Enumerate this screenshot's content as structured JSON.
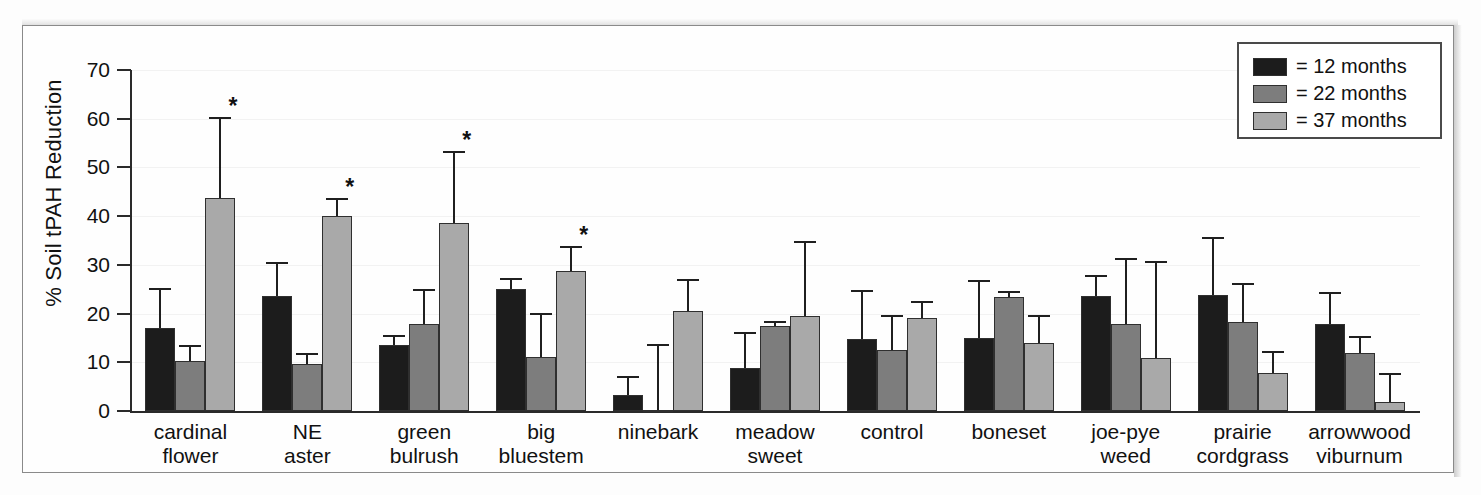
{
  "figure": {
    "ylabel": "% Soil tPAH Reduction",
    "y_ticks": [
      "0",
      "10",
      "20",
      "30",
      "40",
      "50",
      "60",
      "70"
    ],
    "significance_marker": "*"
  },
  "legend": {
    "items": [
      {
        "label": "= 12 months",
        "color": "#1c1c1c",
        "icon": "legend-swatch"
      },
      {
        "label": "= 22 months",
        "color": "#7d7d7d",
        "icon": "legend-swatch"
      },
      {
        "label": "= 37 months",
        "color": "#a9a9a9",
        "icon": "legend-swatch"
      }
    ]
  },
  "chart_data": {
    "type": "bar",
    "title": "",
    "xlabel": "",
    "ylabel": "% Soil tPAH Reduction",
    "ylim": [
      0,
      70
    ],
    "yticks": [
      0,
      10,
      20,
      30,
      40,
      50,
      60,
      70
    ],
    "grid": true,
    "legend_position": "top-right",
    "categories": [
      "cardinal flower",
      "NE aster",
      "green bulrush",
      "big bluestem",
      "ninebark",
      "meadow sweet",
      "control",
      "boneset",
      "joe-pye weed",
      "prairie cordgrass",
      "arrowwood viburnum"
    ],
    "category_lines": [
      [
        "cardinal",
        "flower"
      ],
      [
        "NE",
        "aster"
      ],
      [
        "green",
        "bulrush"
      ],
      [
        "big",
        "bluestem"
      ],
      [
        "ninebark",
        ""
      ],
      [
        "meadow",
        "sweet"
      ],
      [
        "control",
        ""
      ],
      [
        "boneset",
        ""
      ],
      [
        "joe-pye",
        "weed"
      ],
      [
        "prairie",
        "cordgrass"
      ],
      [
        "arrowwood",
        "viburnum"
      ]
    ],
    "series": [
      {
        "name": "12 months",
        "color": "#1c1c1c",
        "values": [
          17.1,
          23.7,
          13.5,
          25.0,
          3.2,
          8.8,
          14.7,
          15.0,
          23.7,
          23.8,
          17.8
        ],
        "errors_upper": [
          8.2,
          6.8,
          2.2,
          2.3,
          4.0,
          7.5,
          10.2,
          11.8,
          4.3,
          12.0,
          6.6
        ],
        "significant": [
          false,
          false,
          false,
          false,
          false,
          false,
          false,
          false,
          false,
          false,
          false
        ]
      },
      {
        "name": "22 months",
        "color": "#7d7d7d",
        "values": [
          10.2,
          9.7,
          17.8,
          11.0,
          0.3,
          17.4,
          12.6,
          23.5,
          17.8,
          18.2,
          11.9
        ],
        "errors_upper": [
          3.4,
          2.3,
          7.2,
          9.2,
          13.4,
          1.1,
          7.2,
          1.1,
          13.7,
          8.1,
          3.4
        ],
        "significant": [
          false,
          false,
          false,
          false,
          false,
          false,
          false,
          false,
          false,
          false,
          false
        ]
      },
      {
        "name": "37 months",
        "color": "#a9a9a9",
        "values": [
          43.8,
          40.1,
          38.5,
          28.7,
          20.6,
          19.6,
          19.1,
          13.9,
          10.8,
          7.9,
          1.8
        ],
        "errors_upper": [
          16.5,
          3.7,
          14.9,
          5.2,
          6.5,
          15.3,
          3.5,
          5.8,
          19.9,
          4.4,
          5.9
        ],
        "significant": [
          true,
          true,
          true,
          true,
          false,
          false,
          false,
          false,
          false,
          false,
          false
        ]
      }
    ]
  }
}
